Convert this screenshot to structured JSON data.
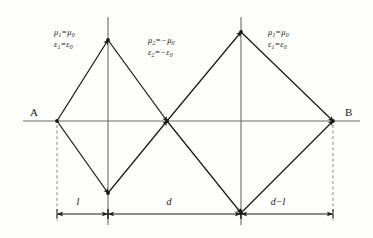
{
  "figure": {
    "caption": "Double-diamond ray path through alternating positive and negative index media between source A and image B",
    "width": 373,
    "height": 238,
    "background_color": "#fdfdfb",
    "line_color": "#1a1a1a",
    "axis_color": "#6b6b6b",
    "dashed_color": "#8a8a8a"
  },
  "endpoints": {
    "left": {
      "label": "A",
      "x": 57,
      "y": 121,
      "label_x": 30,
      "label_y": 106
    },
    "right": {
      "label": "B",
      "x": 333,
      "y": 121,
      "label_x": 345,
      "label_y": 106
    }
  },
  "media_labels": [
    {
      "name": "left-region",
      "x": 54,
      "y": 28,
      "lines": [
        {
          "sym": "μ",
          "sub": "1",
          "op": "=",
          "rhs_sym": "μ",
          "rhs_sub": "0",
          "neg": false
        },
        {
          "sym": "ε",
          "sub": "1",
          "op": "=",
          "rhs_sym": "ε",
          "rhs_sub": "0",
          "neg": false
        }
      ],
      "text": "μ₁=μ₀ ; ε₁=ε₀"
    },
    {
      "name": "middle-region",
      "x": 148,
      "y": 36,
      "lines": [
        {
          "sym": "μ",
          "sub": "2",
          "op": "=",
          "rhs_sym": "μ",
          "rhs_sub": "0",
          "neg": true
        },
        {
          "sym": "ε",
          "sub": "2",
          "op": "=",
          "rhs_sym": "ε",
          "rhs_sub": "0",
          "neg": true
        }
      ],
      "text": "μ₂=−μ₀ ; ε₂=−ε₀"
    },
    {
      "name": "right-region",
      "x": 268,
      "y": 28,
      "lines": [
        {
          "sym": "μ",
          "sub": "1",
          "op": "=",
          "rhs_sym": "μ",
          "rhs_sub": "0",
          "neg": false
        },
        {
          "sym": "ε",
          "sub": "1",
          "op": "=",
          "rhs_sym": "ε",
          "rhs_sub": "0",
          "neg": false
        }
      ],
      "text": "μ₁=μ₀ ; ε₁=ε₀"
    }
  ],
  "dimensions": [
    {
      "name": "dim-l",
      "label": "l",
      "x1": 57,
      "x2": 108,
      "y": 214,
      "label_x": 78,
      "label_y": 196
    },
    {
      "name": "dim-d",
      "label": "d",
      "x1": 108,
      "x2": 241,
      "y": 214,
      "label_x": 169,
      "label_y": 196
    },
    {
      "name": "dim-d-minus-l",
      "label": "d−l",
      "x1": 241,
      "x2": 333,
      "y": 214,
      "label_x": 278,
      "label_y": 196
    }
  ],
  "chart_data": {
    "type": "diagram",
    "axis": {
      "y": 121,
      "x_start": 23,
      "x_end": 360
    },
    "vertical_interfaces": [
      {
        "name": "interface-1",
        "x": 108,
        "y_top": 17,
        "y_bottom": 225
      },
      {
        "name": "interface-2",
        "x": 241,
        "y_top": 17,
        "y_bottom": 225
      }
    ],
    "nodes": [
      {
        "name": "A",
        "x": 57,
        "y": 121
      },
      {
        "name": "left-top-vertex",
        "x": 108,
        "y": 40
      },
      {
        "name": "left-bottom-vertex",
        "x": 108,
        "y": 193
      },
      {
        "name": "center-focus",
        "x": 167,
        "y": 121
      },
      {
        "name": "right-top-vertex",
        "x": 241,
        "y": 32
      },
      {
        "name": "right-bottom-vertex",
        "x": 241,
        "y": 213
      },
      {
        "name": "B",
        "x": 333,
        "y": 121
      }
    ],
    "ray_paths": [
      {
        "name": "upper-left",
        "points": [
          [
            57,
            121
          ],
          [
            108,
            40
          ],
          [
            167,
            121
          ]
        ]
      },
      {
        "name": "lower-left",
        "points": [
          [
            57,
            121
          ],
          [
            108,
            193
          ],
          [
            167,
            121
          ]
        ]
      },
      {
        "name": "upper-right",
        "points": [
          [
            167,
            121
          ],
          [
            241,
            32
          ],
          [
            333,
            121
          ]
        ]
      },
      {
        "name": "lower-right",
        "points": [
          [
            167,
            121
          ],
          [
            241,
            213
          ],
          [
            333,
            121
          ]
        ]
      }
    ],
    "extension_lines": [
      {
        "name": "ext-A",
        "x": 57,
        "y_top": 125,
        "y_bottom": 221
      },
      {
        "name": "ext-B",
        "x": 333,
        "y_top": 125,
        "y_bottom": 221
      }
    ]
  }
}
